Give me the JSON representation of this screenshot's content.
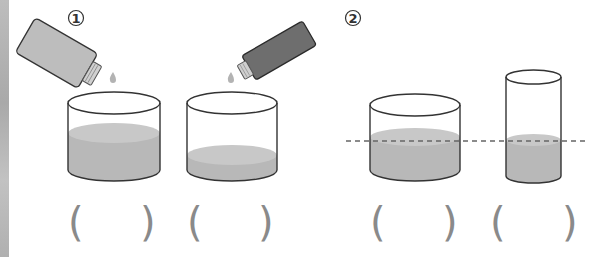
{
  "panels": [
    {
      "label": "1",
      "description": "Pouring liquid from bottles into two containers",
      "bottles": [
        {
          "name": "light-bottle",
          "color": "#bdbdbd"
        },
        {
          "name": "dark-bottle",
          "color": "#6e6e6e"
        }
      ],
      "containers": [
        {
          "name": "container-a",
          "liquid_level": "high",
          "answer": ""
        },
        {
          "name": "container-b",
          "liquid_level": "low",
          "answer": ""
        }
      ]
    },
    {
      "label": "2",
      "description": "Wide and narrow containers with equal liquid height marked by dashed line",
      "containers": [
        {
          "name": "wide-container",
          "answer": ""
        },
        {
          "name": "narrow-container",
          "answer": ""
        }
      ]
    }
  ],
  "parens": {
    "open": "(",
    "close": ")"
  },
  "colors": {
    "liquid": "#b8b8b8",
    "liquid_surface": "#c8c8c8",
    "outline": "#333333",
    "dashed_line": "#666666",
    "paren": "#8a8a8a"
  }
}
